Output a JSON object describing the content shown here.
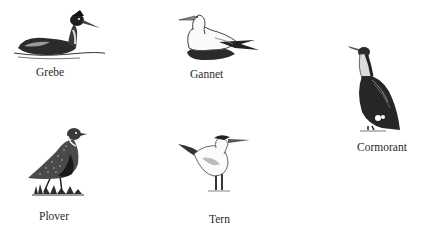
{
  "birds": [
    {
      "name": "Grebe",
      "icon": "grebe-illustration"
    },
    {
      "name": "Gannet",
      "icon": "gannet-illustration"
    },
    {
      "name": "Cormorant",
      "icon": "cormorant-illustration"
    },
    {
      "name": "Plover",
      "icon": "plover-illustration"
    },
    {
      "name": "Tern",
      "icon": "tern-illustration"
    }
  ]
}
